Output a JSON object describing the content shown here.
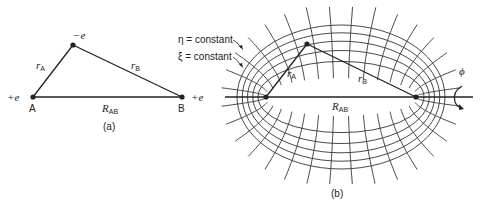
{
  "panel_a": {
    "caption": "(a)",
    "top_charge": "−e",
    "left_charge": "+e",
    "right_charge": "+e",
    "nucleus_a": "A",
    "nucleus_b": "B",
    "r_a": {
      "main": "r",
      "sub": "A"
    },
    "r_b": {
      "main": "r",
      "sub": "B"
    },
    "r_ab": {
      "main": "R",
      "sub": "AB"
    }
  },
  "panel_b": {
    "caption": "(b)",
    "eta_label": "η = constant",
    "xi_label": "ξ = constant",
    "r_a": {
      "main": "r",
      "sub": "A"
    },
    "r_b": {
      "main": "r",
      "sub": "B"
    },
    "r_ab": {
      "main": "R",
      "sub": "AB"
    },
    "phi_label": "ϕ",
    "ellipse_count": 5,
    "hyperbola_count": 16
  },
  "colors": {
    "ink": "#222222",
    "background": "#ffffff"
  }
}
